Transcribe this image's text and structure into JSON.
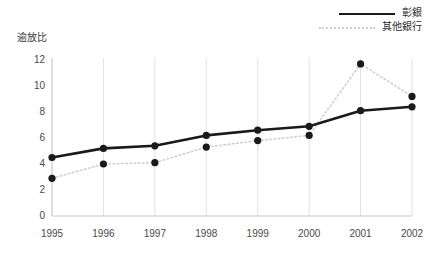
{
  "chart_data": {
    "type": "line",
    "title": "",
    "subtitle": "",
    "xlabel": "",
    "ylabel": "逾放比",
    "categories": [
      "1995",
      "1996",
      "1997",
      "1998",
      "1999",
      "2000",
      "2001",
      "2002"
    ],
    "x": [
      1995,
      1996,
      1997,
      1998,
      1999,
      2000,
      2001,
      2002
    ],
    "series": [
      {
        "name": "彰銀",
        "style": "solid",
        "color": "#1a1a1a",
        "marker": "circle",
        "values": [
          4.5,
          5.2,
          5.4,
          6.2,
          6.6,
          6.9,
          8.1,
          8.4
        ]
      },
      {
        "name": "其他銀行",
        "style": "dotted",
        "color": "#d0d0d0",
        "marker": "circle",
        "values": [
          2.9,
          4.0,
          4.1,
          5.3,
          5.8,
          6.2,
          11.7,
          9.2
        ]
      }
    ],
    "ylim": [
      0,
      12
    ],
    "yticks": [
      0,
      2,
      4,
      6,
      8,
      10,
      12
    ],
    "ytick_labels": [
      "0",
      "2",
      "4",
      "6",
      "8",
      "10",
      "12"
    ],
    "grid": "vertical-only",
    "legend_position": "top-right",
    "marker_color": "#1a1a1a"
  },
  "legend": {
    "items": [
      {
        "label": "彰銀"
      },
      {
        "label": "其他銀行"
      }
    ]
  },
  "axes": {
    "y_title": "逾放比"
  },
  "colors": {
    "background": "#ffffff",
    "axis": "#c8c8c8",
    "gridline": "#e2e2e2",
    "series_primary": "#1a1a1a",
    "series_secondary": "#d0d0d0",
    "tick_text": "#4a4a4a"
  }
}
